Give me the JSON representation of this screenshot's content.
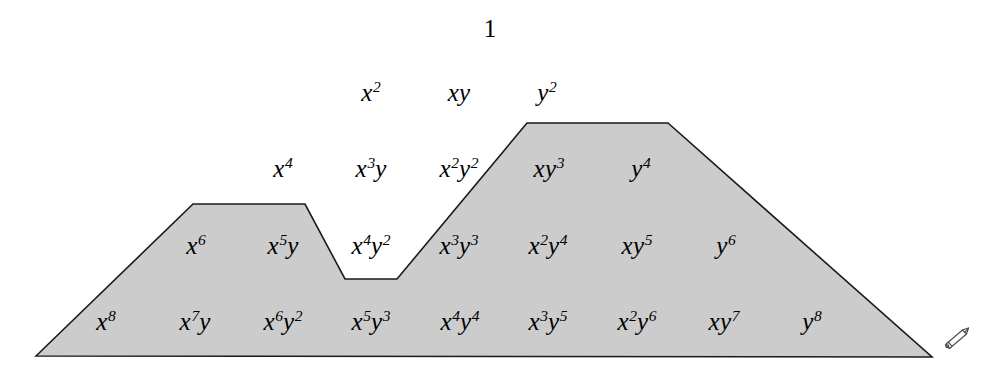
{
  "figure": {
    "title_symbol": "1",
    "colors": {
      "fill": "#cccccc",
      "stroke": "#1a1a1a",
      "text": "#000000",
      "background": "#ffffff"
    }
  },
  "chart_data": {
    "type": "diagram",
    "rows": [
      {
        "degree": 0,
        "y": 28,
        "terms": [
          {
            "text": "1",
            "x": 490,
            "base": "1",
            "exp": "",
            "second": "",
            "second_exp": "",
            "shaded": false
          }
        ]
      },
      {
        "degree": 2,
        "y": 92,
        "terms": [
          {
            "text": "x2",
            "x": 371,
            "base": "x",
            "exp": "2",
            "second": "",
            "second_exp": "",
            "shaded": false
          },
          {
            "text": "xy",
            "x": 459,
            "base": "x",
            "exp": "",
            "second": "y",
            "second_exp": "",
            "shaded": false
          },
          {
            "text": "y2",
            "x": 547,
            "base": "y",
            "exp": "2",
            "second": "",
            "second_exp": "",
            "shaded": false
          }
        ]
      },
      {
        "degree": 4,
        "y": 168,
        "terms": [
          {
            "text": "x4",
            "x": 283,
            "base": "x",
            "exp": "4",
            "second": "",
            "second_exp": "",
            "shaded": false
          },
          {
            "text": "x3y",
            "x": 371,
            "base": "x",
            "exp": "3",
            "second": "y",
            "second_exp": "",
            "shaded": false
          },
          {
            "text": "x2y2",
            "x": 459,
            "base": "x",
            "exp": "2",
            "second": "y",
            "second_exp": "2",
            "shaded": false
          },
          {
            "text": "xy3",
            "x": 549,
            "base": "x",
            "exp": "",
            "second": "y",
            "second_exp": "3",
            "shaded": true
          },
          {
            "text": "y4",
            "x": 641,
            "base": "y",
            "exp": "4",
            "second": "",
            "second_exp": "",
            "shaded": true
          }
        ]
      },
      {
        "degree": 6,
        "y": 245,
        "terms": [
          {
            "text": "x6",
            "x": 196,
            "base": "x",
            "exp": "6",
            "second": "",
            "second_exp": "",
            "shaded": true
          },
          {
            "text": "x5y",
            "x": 283,
            "base": "x",
            "exp": "5",
            "second": "y",
            "second_exp": "",
            "shaded": true
          },
          {
            "text": "x4y2",
            "x": 371,
            "base": "x",
            "exp": "4",
            "second": "y",
            "second_exp": "2",
            "shaded": false
          },
          {
            "text": "x3y3",
            "x": 459,
            "base": "x",
            "exp": "3",
            "second": "y",
            "second_exp": "3",
            "shaded": true
          },
          {
            "text": "x2y4",
            "x": 548,
            "base": "x",
            "exp": "2",
            "second": "y",
            "second_exp": "4",
            "shaded": true
          },
          {
            "text": "xy5",
            "x": 637,
            "base": "x",
            "exp": "",
            "second": "y",
            "second_exp": "5",
            "shaded": true
          },
          {
            "text": "y6",
            "x": 726,
            "base": "y",
            "exp": "6",
            "second": "",
            "second_exp": "",
            "shaded": true
          }
        ]
      },
      {
        "degree": 8,
        "y": 321,
        "terms": [
          {
            "text": "x8",
            "x": 106,
            "base": "x",
            "exp": "8",
            "second": "",
            "second_exp": "",
            "shaded": true
          },
          {
            "text": "x7y",
            "x": 195,
            "base": "x",
            "exp": "7",
            "second": "y",
            "second_exp": "",
            "shaded": true
          },
          {
            "text": "x6y2",
            "x": 283,
            "base": "x",
            "exp": "6",
            "second": "y",
            "second_exp": "2",
            "shaded": true
          },
          {
            "text": "x5y3",
            "x": 371,
            "base": "x",
            "exp": "5",
            "second": "y",
            "second_exp": "3",
            "shaded": true
          },
          {
            "text": "x4y4",
            "x": 460,
            "base": "x",
            "exp": "4",
            "second": "y",
            "second_exp": "4",
            "shaded": true
          },
          {
            "text": "x3y5",
            "x": 548,
            "base": "x",
            "exp": "3",
            "second": "y",
            "second_exp": "5",
            "shaded": true
          },
          {
            "text": "x2y6",
            "x": 637,
            "base": "x",
            "exp": "2",
            "second": "y",
            "second_exp": "6",
            "shaded": true
          },
          {
            "text": "xy7",
            "x": 724,
            "base": "x",
            "exp": "",
            "second": "y",
            "second_exp": "7",
            "shaded": true
          },
          {
            "text": "y8",
            "x": 812,
            "base": "y",
            "exp": "8",
            "second": "",
            "second_exp": "",
            "shaded": true
          }
        ]
      }
    ],
    "shaded_region": {
      "fill": "#cccccc",
      "stroke": "#1a1a1a",
      "stroke_width": 1.6,
      "points": "36,356 193,204 305,204 345,279 397,279 527,123 668,123 932,357 36,356"
    },
    "annotations": [
      {
        "name": "pencil-icon",
        "x": 938,
        "y": 322,
        "label": "pencil"
      }
    ]
  }
}
